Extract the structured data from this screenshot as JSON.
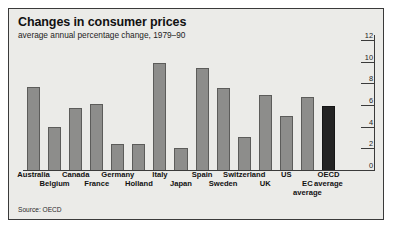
{
  "figure": {
    "title": "Changes in consumer prices",
    "subtitle": "average annual percentage change, 1979–90",
    "source": "Source: OECD",
    "frame_color": "#3a3a3a",
    "background_color": "#ebebe8",
    "bar_color": "#8d8d8b",
    "highlight_bar_color": "#232323"
  },
  "chart_data": {
    "type": "bar",
    "title": "Changes in consumer prices",
    "subtitle": "average annual percentage change, 1979–90",
    "xlabel": "",
    "ylabel": "",
    "ylim": [
      0,
      12
    ],
    "yticks": [
      0,
      2,
      4,
      6,
      8,
      10,
      12
    ],
    "ytick_labels": [
      "0",
      "2",
      "4",
      "6",
      "8",
      "10",
      "12"
    ],
    "axis_position": "right",
    "grid": false,
    "legend": "none",
    "source": "Source: OECD",
    "categories": [
      "Australia",
      "Belgium",
      "Canada",
      "France",
      "Germany",
      "Holland",
      "Italy",
      "Japan",
      "Spain",
      "Sweden",
      "Switzerland",
      "UK",
      "US",
      "EC average",
      "OECD average"
    ],
    "values": [
      7.8,
      4.1,
      5.8,
      6.2,
      2.5,
      2.5,
      10.0,
      2.1,
      9.5,
      7.7,
      3.1,
      7.0,
      5.1,
      6.8,
      6.0
    ],
    "highlight_categories": [
      "OECD average"
    ],
    "label_rows": [
      0,
      1,
      0,
      1,
      0,
      1,
      0,
      1,
      0,
      1,
      0,
      1,
      0,
      1,
      0
    ],
    "label_lines": [
      [
        "Australia"
      ],
      [
        "Belgium"
      ],
      [
        "Canada"
      ],
      [
        "France"
      ],
      [
        "Germany"
      ],
      [
        "Holland"
      ],
      [
        "Italy"
      ],
      [
        "Japan"
      ],
      [
        "Spain"
      ],
      [
        "Sweden"
      ],
      [
        "Switzerland"
      ],
      [
        "UK"
      ],
      [
        "US"
      ],
      [
        "EC",
        "average"
      ],
      [
        "OECD",
        "average"
      ]
    ]
  }
}
